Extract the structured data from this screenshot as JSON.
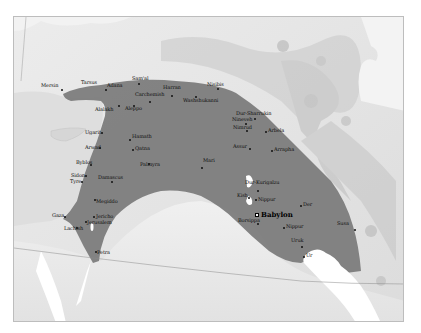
{
  "map": {
    "region_color": "#7a7a7a",
    "land_color": "#e4e4e4",
    "sea_color": "#d2d2d2",
    "water_color": "#ffffff",
    "capital": {
      "name": "Babylon",
      "x": 256,
      "y": 199
    },
    "cities": [
      {
        "name": "Mersin",
        "x": 60,
        "y": 88
      },
      {
        "name": "Tarsus",
        "x": 82,
        "y": 84
      },
      {
        "name": "Adana",
        "x": 104,
        "y": 88
      },
      {
        "name": "Sam'al",
        "x": 137,
        "y": 82
      },
      {
        "name": "Harran",
        "x": 170,
        "y": 90
      },
      {
        "name": "Nisibis",
        "x": 216,
        "y": 87
      },
      {
        "name": "Carchemish",
        "x": 148,
        "y": 95
      },
      {
        "name": "Washshukanni",
        "x": 194,
        "y": 95
      },
      {
        "name": "Alalakh",
        "x": 110,
        "y": 104
      },
      {
        "name": "Aleppo",
        "x": 132,
        "y": 104
      },
      {
        "name": "Dur-Sharrukin",
        "x": 253,
        "y": 117
      },
      {
        "name": "Nineveh",
        "x": 244,
        "y": 122
      },
      {
        "name": "Nimrud",
        "x": 245,
        "y": 129
      },
      {
        "name": "Arbela",
        "x": 264,
        "y": 130
      },
      {
        "name": "Assur",
        "x": 248,
        "y": 147
      },
      {
        "name": "Arrapha",
        "x": 270,
        "y": 149
      },
      {
        "name": "Ugarit",
        "x": 100,
        "y": 131
      },
      {
        "name": "Hamath",
        "x": 128,
        "y": 138
      },
      {
        "name": "Arwad",
        "x": 98,
        "y": 146
      },
      {
        "name": "Qatna",
        "x": 131,
        "y": 148
      },
      {
        "name": "Byblos",
        "x": 89,
        "y": 163
      },
      {
        "name": "Palmyra",
        "x": 147,
        "y": 162
      },
      {
        "name": "Mari",
        "x": 200,
        "y": 162
      },
      {
        "name": "Sidon",
        "x": 84,
        "y": 174
      },
      {
        "name": "Tyre",
        "x": 80,
        "y": 180
      },
      {
        "name": "Damascus",
        "x": 110,
        "y": 180
      },
      {
        "name": "Megiddo",
        "x": 93,
        "y": 198
      },
      {
        "name": "Gaza",
        "x": 63,
        "y": 215
      },
      {
        "name": "Jericho",
        "x": 92,
        "y": 215
      },
      {
        "name": "Jerusalem",
        "x": 84,
        "y": 220
      },
      {
        "name": "Lachish",
        "x": 75,
        "y": 226
      },
      {
        "name": "Petra",
        "x": 94,
        "y": 250
      },
      {
        "name": "Dur-Kurigalzu",
        "x": 256,
        "y": 189
      },
      {
        "name": "Kish",
        "x": 247,
        "y": 196
      },
      {
        "name": "Nippur",
        "x": 267,
        "y": 204
      },
      {
        "name": "Der",
        "x": 299,
        "y": 204
      },
      {
        "name": "Borsippa",
        "x": 256,
        "y": 222
      },
      {
        "name": "Nippur-south",
        "x": 282,
        "y": 226
      },
      {
        "name": "Susa",
        "x": 339,
        "y": 228
      },
      {
        "name": "Uruk",
        "x": 292,
        "y": 245
      },
      {
        "name": "Ur",
        "x": 302,
        "y": 255
      }
    ],
    "labels": [
      {
        "text": "Mersin",
        "x": 40,
        "y": 82
      },
      {
        "text": "Tarsus",
        "x": 80,
        "y": 79
      },
      {
        "text": "Adana",
        "x": 106,
        "y": 82
      },
      {
        "text": "Sam'al",
        "x": 131,
        "y": 75
      },
      {
        "text": "Harran",
        "x": 162,
        "y": 84
      },
      {
        "text": "Nisibis",
        "x": 206,
        "y": 81
      },
      {
        "text": "Carchemish",
        "x": 134,
        "y": 91
      },
      {
        "text": "Washshukanni",
        "x": 182,
        "y": 97
      },
      {
        "text": "Alalakh",
        "x": 94,
        "y": 106
      },
      {
        "text": "Aleppo",
        "x": 124,
        "y": 105
      },
      {
        "text": "Dur-Sharrukin",
        "x": 235,
        "y": 110
      },
      {
        "text": "Nineveh",
        "x": 231,
        "y": 116
      },
      {
        "text": "Nimrud",
        "x": 232,
        "y": 124
      },
      {
        "text": "Arbela",
        "x": 264,
        "y": 127
      },
      {
        "text": "Assur",
        "x": 232,
        "y": 143
      },
      {
        "text": "Arrapha",
        "x": 262,
        "y": 146
      },
      {
        "text": "Ugarit",
        "x": 84,
        "y": 129
      },
      {
        "text": "Hamath",
        "x": 125,
        "y": 133
      },
      {
        "text": "Arwad",
        "x": 84,
        "y": 144
      },
      {
        "text": "Qatna",
        "x": 128,
        "y": 145
      },
      {
        "text": "Byblos",
        "x": 75,
        "y": 159
      },
      {
        "text": "Palmyra",
        "x": 139,
        "y": 161
      },
      {
        "text": "Mari",
        "x": 202,
        "y": 157
      },
      {
        "text": "Sidon",
        "x": 70,
        "y": 172
      },
      {
        "text": "Tyre",
        "x": 69,
        "y": 178
      },
      {
        "text": "Damascus",
        "x": 97,
        "y": 174
      },
      {
        "text": "Megiddo",
        "x": 93,
        "y": 198
      },
      {
        "text": "Gaza",
        "x": 51,
        "y": 212
      },
      {
        "text": "Jericho",
        "x": 83,
        "y": 213
      },
      {
        "text": "Jerusalem",
        "x": 80,
        "y": 219
      },
      {
        "text": "Lachish",
        "x": 63,
        "y": 225
      },
      {
        "text": "Petra",
        "x": 91,
        "y": 249
      },
      {
        "text": "Dur-Kurigalzu",
        "x": 244,
        "y": 178
      },
      {
        "text": "Kish",
        "x": 236,
        "y": 189
      },
      {
        "text": "Nippur",
        "x": 256,
        "y": 191
      },
      {
        "text": "Der",
        "x": 301,
        "y": 201
      },
      {
        "text": "Borsippa",
        "x": 237,
        "y": 217
      },
      {
        "text": "Nippur",
        "x": 272,
        "y": 225
      },
      {
        "text": "Susa",
        "x": 336,
        "y": 220
      },
      {
        "text": "Uruk",
        "x": 284,
        "y": 236
      },
      {
        "text": "Ur",
        "x": 301,
        "y": 251
      }
    ]
  }
}
